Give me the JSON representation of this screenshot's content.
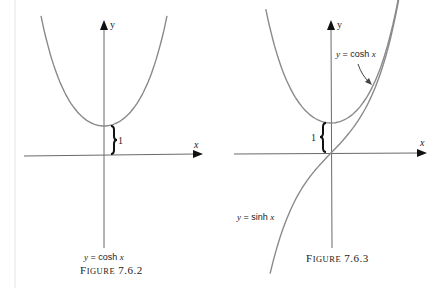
{
  "figures": [
    {
      "id": "fig1",
      "caption": "Figure 7.6.2",
      "caption_prefix": "F",
      "caption_smallcaps": "IGURE",
      "caption_number": "7.6.2",
      "curve_label": "y = cosh x",
      "axis_x_label": "x",
      "axis_y_label": "y",
      "brace_label": "1"
    },
    {
      "id": "fig2",
      "caption": "Figure 7.6.3",
      "caption_prefix": "F",
      "caption_smallcaps": "IGURE",
      "caption_number": "7.6.3",
      "cosh_label": "y = cosh x",
      "sinh_label": "y = sinh x",
      "axis_x_label": "x",
      "axis_y_label": "y",
      "brace_label": "1"
    }
  ],
  "colors": {
    "curve": "#8a8a8a",
    "axis": "#6a6a6a",
    "brace": "#111111",
    "margin_line": "#dddddd"
  }
}
